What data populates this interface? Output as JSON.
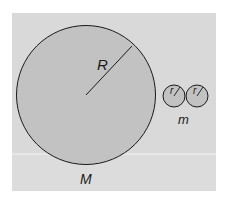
{
  "figure": {
    "colors": {
      "background": "#ffffff",
      "panel": "#d9d9d9",
      "panel_lower": "#dcdcdc",
      "divider": "#f4f4f4",
      "circle_fill": "#c2c2c2",
      "stroke": "#1a1a1a"
    },
    "large_sphere": {
      "radius_label": "R",
      "mass_label": "M"
    },
    "small_spheres": {
      "count": 2,
      "radius_labels": [
        "r",
        "r"
      ],
      "mass_label": "m"
    }
  }
}
